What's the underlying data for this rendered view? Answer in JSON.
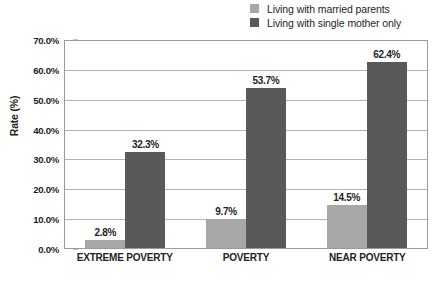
{
  "chart_data": {
    "type": "bar",
    "title": "",
    "subtitle": "",
    "xlabel": "",
    "ylabel": "Rate (%)",
    "ylim": [
      0,
      70
    ],
    "grid": true,
    "legend_position": "top-right",
    "categories": [
      "EXTREME POVERTY",
      "POVERTY",
      "NEAR POVERTY"
    ],
    "ytick_labels": [
      "70.0%",
      "60.0%",
      "50.0%",
      "40.0%",
      "30.0%",
      "20.0%",
      "10.0%",
      "0.0%"
    ],
    "ytick_values": [
      70,
      60,
      50,
      40,
      30,
      20,
      10,
      0
    ],
    "series": [
      {
        "name": "Living with married parents",
        "color": "#a7a7a7",
        "values": [
          2.8,
          9.7,
          14.5
        ],
        "labels": [
          "2.8%",
          "9.7%",
          "14.5%"
        ]
      },
      {
        "name": "Living with single mother only",
        "color": "#595959",
        "values": [
          32.3,
          53.7,
          62.4
        ],
        "labels": [
          "32.3%",
          "53.7%",
          "62.4%"
        ]
      }
    ]
  },
  "colors": {
    "light_bar": "#a7a7a7",
    "dark_bar": "#595959",
    "gridline": "#b3b3b3",
    "axis": "#9a9a9a",
    "text": "#231f20",
    "background": "#ffffff"
  }
}
